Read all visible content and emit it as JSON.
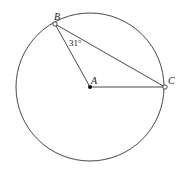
{
  "diagram": {
    "points": {
      "A": {
        "label": "A",
        "x": 90,
        "y": 87
      },
      "B": {
        "label": "B",
        "x": 55,
        "y": 24
      },
      "C": {
        "label": "C",
        "x": 165,
        "y": 87
      }
    },
    "circle": {
      "center": "A",
      "radius": 73
    },
    "angle_label": "31°",
    "segments": [
      [
        "A",
        "B"
      ],
      [
        "B",
        "C"
      ],
      [
        "A",
        "C"
      ]
    ]
  }
}
